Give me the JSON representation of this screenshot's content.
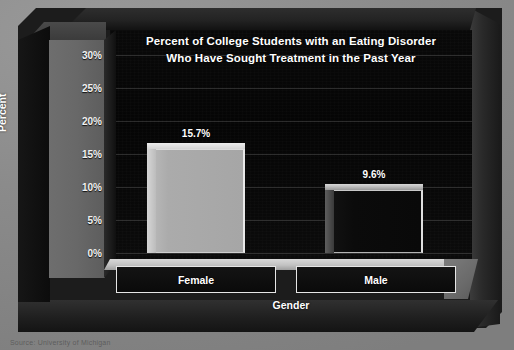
{
  "chart_data": {
    "type": "bar",
    "title": "Percent of College Students with an Eating Disorder Who Have Sought Treatment in the Past Year",
    "title_line1": "Percent of College Students with an Eating Disorder",
    "title_line2": "Who Have Sought Treatment in the Past Year",
    "xlabel": "Gender",
    "ylabel": "Percent",
    "categories": [
      "Female",
      "Male"
    ],
    "values": [
      15.7,
      9.6
    ],
    "value_labels": [
      "15.7%",
      "9.6%"
    ],
    "ylim": [
      0,
      30
    ],
    "ytick_values": [
      0,
      5,
      10,
      15,
      20,
      25,
      30
    ],
    "ytick_labels": [
      "0%",
      "5%",
      "10%",
      "15%",
      "20%",
      "25%",
      "30%"
    ],
    "grid": true,
    "legend": false,
    "legend_position": "none",
    "series": [
      {
        "name": "Percent sought treatment",
        "values": [
          15.7,
          9.6
        ]
      }
    ],
    "bar_colors": [
      "#b0b0b0",
      "#0d0d0d"
    ]
  },
  "style": {
    "plot_background": "#070707",
    "wall_color": "#686868",
    "floor_color": "#c8c8c8",
    "text_color": "#ffffff",
    "page_background": "#8b8b8b"
  },
  "footer": {
    "source_note": "Source: University of Michigan"
  }
}
